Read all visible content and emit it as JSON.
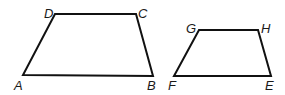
{
  "diagram": {
    "type": "geometry-figure",
    "stroke_color": "#111111",
    "shapes": [
      {
        "name": "trapezoid-ABCD",
        "vertices": [
          {
            "label": "A",
            "x": 23,
            "y": 75,
            "label_x": 14,
            "label_y": 90
          },
          {
            "label": "B",
            "x": 153,
            "y": 76,
            "label_x": 147,
            "label_y": 90
          },
          {
            "label": "C",
            "x": 136,
            "y": 14,
            "label_x": 138,
            "label_y": 18
          },
          {
            "label": "D",
            "x": 55,
            "y": 14,
            "label_x": 44,
            "label_y": 18
          }
        ]
      },
      {
        "name": "trapezoid-EFGH",
        "vertices": [
          {
            "label": "F",
            "x": 174,
            "y": 76,
            "label_x": 168,
            "label_y": 90
          },
          {
            "label": "E",
            "x": 271,
            "y": 76,
            "label_x": 265,
            "label_y": 90
          },
          {
            "label": "H",
            "x": 258,
            "y": 30,
            "label_x": 261,
            "label_y": 33
          },
          {
            "label": "G",
            "x": 199,
            "y": 30,
            "label_x": 186,
            "label_y": 33
          }
        ]
      }
    ]
  }
}
